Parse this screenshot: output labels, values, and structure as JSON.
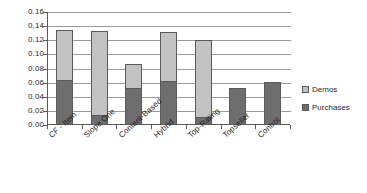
{
  "chart_data": {
    "type": "bar",
    "subtype": "stacked-vertical",
    "title": "",
    "xlabel": "",
    "ylabel": "",
    "categories": [
      "CF - Item",
      "Slope One",
      "Content-Based",
      "Hybrid",
      "Top-Rating",
      "Topseller",
      "Control"
    ],
    "series": [
      {
        "name": "Purchases",
        "color": "#6e6e6e",
        "values": [
          0.064,
          0.014,
          0.053,
          0.062,
          0.012,
          0.052,
          0.061
        ]
      },
      {
        "name": "Demos",
        "color": "#c2c2c2",
        "values": [
          0.071,
          0.119,
          0.033,
          0.07,
          0.108,
          0.0,
          0.0
        ]
      }
    ],
    "stack_order_bottom_to_top": [
      "Purchases",
      "Demos"
    ],
    "totals": [
      0.135,
      0.133,
      0.086,
      0.132,
      0.12,
      0.052,
      0.061
    ],
    "ylim": [
      0.0,
      0.16
    ],
    "ytick_values": [
      0.0,
      0.02,
      0.04,
      0.06,
      0.08,
      0.1,
      0.12,
      0.14,
      0.16
    ],
    "ytick_labels": [
      "0.00",
      "0.02",
      "0.04",
      "0.06",
      "0.08",
      "0.10",
      "0.12",
      "0.14",
      "0.16"
    ],
    "grid": {
      "horizontal": true,
      "vertical": false
    },
    "legend": {
      "position": "right",
      "entries": [
        {
          "label": "Demos",
          "swatch": "demos-swatch",
          "color": "#c2c2c2"
        },
        {
          "label": "Purchases",
          "swatch": "purchases-swatch",
          "color": "#6e6e6e"
        }
      ]
    },
    "xlabel_rotation_degrees": -42
  }
}
